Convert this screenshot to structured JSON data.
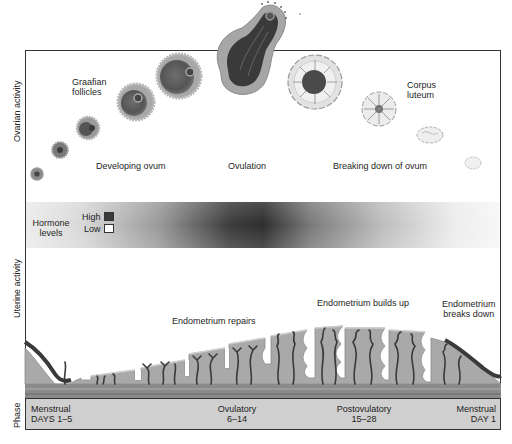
{
  "axis_labels": {
    "ovarian": "Ovarian activity",
    "uterine": "Uterine activity",
    "phase": "Phase"
  },
  "ovarian": {
    "graafian_line1": "Graafian",
    "graafian_line2": "follicles",
    "developing": "Developing ovum",
    "ovulation": "Ovulation",
    "breaking": "Breaking down of ovum",
    "corpus_line1": "Corpus",
    "corpus_line2": "luteum"
  },
  "hormone": {
    "title_line1": "Hormone",
    "title_line2": "levels",
    "high": "High",
    "low": "Low",
    "high_color": "#3a3a3a",
    "low_color": "#ffffff"
  },
  "uterine": {
    "repairs": "Endometrium repairs",
    "builds": "Endometrium builds up",
    "breaks_line1": "Endometrium",
    "breaks_line2": "breaks down"
  },
  "phases": [
    {
      "name": "Menstrual",
      "days": "DAYS 1–5"
    },
    {
      "name": "Ovulatory",
      "days": "6–14"
    },
    {
      "name": "Postovulatory",
      "days": "15–28"
    },
    {
      "name": "Menstrual",
      "days": "DAY 1"
    }
  ]
}
